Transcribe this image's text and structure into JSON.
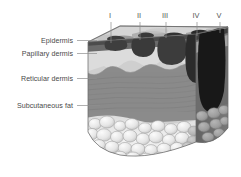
{
  "figure": {
    "type": "anatomical-diagram",
    "background_color": "#ffffff"
  },
  "layer_labels": [
    {
      "id": "epidermis",
      "text": "Epidermis",
      "x": 73,
      "y": 43,
      "leader_to_x": 96,
      "leader_y": 41
    },
    {
      "id": "papillary-dermis",
      "text": "Papillary dermis",
      "x": 73,
      "y": 56,
      "leader_to_x": 96,
      "leader_y": 54
    },
    {
      "id": "reticular-dermis",
      "text": "Reticular dermis",
      "x": 73,
      "y": 81,
      "leader_to_x": 96,
      "leader_y": 79
    },
    {
      "id": "subcutaneous-fat",
      "text": "Subcutaneous fat",
      "x": 73,
      "y": 108,
      "leader_to_x": 100,
      "leader_y": 106
    }
  ],
  "clark_levels": [
    {
      "id": "level-1",
      "numeral": "I",
      "x": 110,
      "line_x": 111,
      "line_top": 20,
      "line_bottom": 43
    },
    {
      "id": "level-2",
      "numeral": "II",
      "x": 138,
      "line_x": 140,
      "line_top": 20,
      "line_bottom": 40
    },
    {
      "id": "level-3",
      "numeral": "III",
      "x": 163,
      "line_x": 166,
      "line_top": 20,
      "line_bottom": 38
    },
    {
      "id": "level-4",
      "numeral": "IV",
      "x": 194,
      "line_x": 197,
      "line_top": 20,
      "line_bottom": 36
    },
    {
      "id": "level-5",
      "numeral": "V",
      "x": 218,
      "line_x": 220,
      "line_top": 20,
      "line_bottom": 34
    }
  ],
  "colors": {
    "label_text": "#4a4a4a",
    "leader_line": "#8e8e8e",
    "top_surface": "#d0d0d0",
    "epidermis": "#5a5a5a",
    "papillary_dermis": "#d9d9d9",
    "reticular_dermis": "#8c8c8c",
    "reticular_dermis_striation": "#7a7a7a",
    "subcutaneous_fat": "#ececec",
    "fat_outline": "#9a9a9a",
    "lesion_dark": "#3c3c3c",
    "lesion_darkest": "#1e1e1e",
    "right_face_shade": "#6e6e6e",
    "outline": "#6b6b6b"
  },
  "geometry": {
    "front_top_left_x": 88,
    "front_top_left_y": 42,
    "front_top_right_x": 196,
    "front_top_right_y": 34,
    "back_top_right_x": 228,
    "back_top_right_y": 28,
    "block_bottom_y": 160
  }
}
